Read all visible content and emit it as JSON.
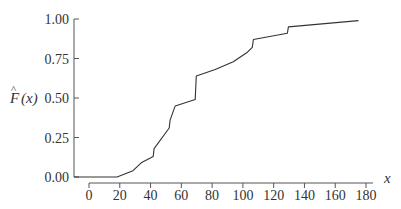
{
  "chart_data": {
    "type": "line",
    "title": "",
    "xlabel": "x",
    "ylabel": "F̂(x)",
    "xlim": [
      0,
      180
    ],
    "ylim": [
      0,
      1
    ],
    "grid": false,
    "legend": null,
    "x_ticks": [
      0,
      20,
      40,
      60,
      80,
      100,
      120,
      140,
      160,
      180
    ],
    "x_tick_labels": [
      "0",
      "20",
      "40",
      "60",
      "80",
      "100",
      "120",
      "140",
      "160",
      "180"
    ],
    "y_ticks": [
      0,
      0.25,
      0.5,
      0.75,
      1.0
    ],
    "y_tick_labels": [
      "0.00",
      "0.25",
      "0.50",
      "0.75",
      "1.00"
    ],
    "series": [
      {
        "name": "Empirical CDF estimate",
        "x": [
          18.2,
          28.6,
          33.9,
          41.7,
          42.3,
          52.1,
          52.7,
          56.0,
          69.0,
          69.7,
          82.0,
          93.8,
          102.9,
          106.1,
          106.8,
          128.9,
          129.6,
          175.1
        ],
        "y": [
          0.0,
          0.04,
          0.09,
          0.13,
          0.18,
          0.31,
          0.36,
          0.45,
          0.49,
          0.64,
          0.68,
          0.73,
          0.79,
          0.82,
          0.87,
          0.91,
          0.95,
          0.99
        ]
      }
    ]
  },
  "axes": {
    "xlabel": "x",
    "ylabel_main": "F",
    "ylabel_arg": "(x)",
    "ylabel_hat": "^"
  }
}
